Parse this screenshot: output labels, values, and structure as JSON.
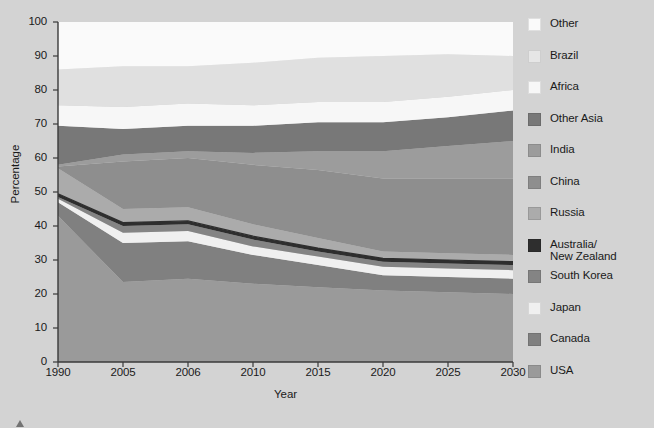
{
  "chart_data": {
    "type": "area",
    "stacked": true,
    "title": "",
    "xlabel": "Year",
    "ylabel": "Percentage",
    "x": [
      "1990",
      "2005",
      "2006",
      "2010",
      "2015",
      "2020",
      "2025",
      "2030"
    ],
    "xtick_labels": [
      "1990",
      "2005",
      "2006",
      "2010",
      "2015",
      "2020",
      "2025",
      "2030"
    ],
    "ytick_labels": [
      "0",
      "10",
      "20",
      "30",
      "40",
      "50",
      "60",
      "70",
      "80",
      "90",
      "100"
    ],
    "ylim": [
      0,
      100
    ],
    "yticks": [
      0,
      10,
      20,
      30,
      40,
      50,
      60,
      70,
      80,
      90,
      100
    ],
    "grid": false,
    "legend_position": "right",
    "stack_order_bottom_to_top": [
      "USA",
      "Canada",
      "Japan",
      "South Korea",
      "Australia/New Zealand",
      "Russia",
      "China",
      "India",
      "Other Asia",
      "Africa",
      "Brazil",
      "Other"
    ],
    "series": [
      {
        "name": "USA",
        "color": "#9a9a9a",
        "values": [
          43.0,
          23.5,
          24.5,
          23.0,
          22.0,
          21.0,
          20.5,
          20.0
        ]
      },
      {
        "name": "Canada",
        "color": "#808080",
        "values": [
          4.0,
          11.5,
          11.0,
          8.5,
          6.5,
          4.5,
          4.5,
          4.5
        ]
      },
      {
        "name": "Japan",
        "color": "#f0f0f0",
        "values": [
          1.0,
          3.0,
          3.0,
          2.5,
          2.5,
          2.5,
          2.5,
          2.5
        ]
      },
      {
        "name": "South Korea",
        "color": "#848484",
        "values": [
          0.5,
          2.0,
          2.0,
          2.0,
          1.5,
          1.5,
          1.5,
          1.5
        ]
      },
      {
        "name": "Australia/New Zealand",
        "color": "#2e2e2e",
        "values": [
          1.0,
          1.0,
          1.0,
          1.0,
          1.0,
          1.0,
          1.0,
          1.0
        ]
      },
      {
        "name": "Russia",
        "color": "#ababab",
        "values": [
          7.5,
          4.0,
          4.0,
          3.5,
          3.0,
          2.0,
          2.0,
          2.0
        ]
      },
      {
        "name": "China",
        "color": "#8e8e8e",
        "values": [
          0.5,
          14.0,
          14.5,
          17.5,
          20.0,
          21.5,
          22.0,
          22.5
        ]
      },
      {
        "name": "India",
        "color": "#9c9c9c",
        "values": [
          0.5,
          2.0,
          2.0,
          3.5,
          5.5,
          8.0,
          9.5,
          11.0
        ]
      },
      {
        "name": "Other Asia",
        "color": "#787878",
        "values": [
          11.5,
          7.5,
          7.5,
          8.0,
          8.5,
          8.5,
          8.5,
          9.0
        ]
      },
      {
        "name": "Africa",
        "color": "#f7f7f7",
        "values": [
          6.0,
          6.5,
          6.5,
          6.0,
          6.0,
          6.0,
          6.0,
          6.0
        ]
      },
      {
        "name": "Brazil",
        "color": "#e0e0e0",
        "values": [
          10.5,
          12.0,
          11.0,
          12.5,
          13.0,
          13.5,
          12.5,
          10.0
        ]
      },
      {
        "name": "Other",
        "color": "#fafafa",
        "values": [
          14.0,
          13.0,
          13.0,
          12.0,
          10.5,
          10.0,
          9.5,
          10.0
        ]
      }
    ],
    "cumulative_tops": {
      "USA": [
        43.0,
        23.5,
        24.5,
        23.0,
        22.0,
        21.0,
        20.5,
        20.0
      ],
      "Canada": [
        47.0,
        35.0,
        35.5,
        31.5,
        28.5,
        25.5,
        25.0,
        24.5
      ],
      "Japan": [
        48.0,
        38.0,
        38.5,
        34.0,
        31.0,
        28.0,
        27.5,
        27.0
      ],
      "South Korea": [
        48.5,
        40.0,
        40.5,
        36.0,
        32.5,
        29.5,
        29.0,
        28.5
      ],
      "Australia/New Zealand": [
        49.5,
        41.0,
        41.5,
        37.0,
        33.5,
        30.5,
        30.0,
        29.5
      ],
      "Russia": [
        57.0,
        45.0,
        45.5,
        40.5,
        36.5,
        32.5,
        32.0,
        31.5
      ],
      "China": [
        57.5,
        59.0,
        60.0,
        58.0,
        56.5,
        54.0,
        54.0,
        54.0
      ],
      "India": [
        58.0,
        61.0,
        62.0,
        61.5,
        62.0,
        62.0,
        63.5,
        65.0
      ],
      "Other Asia": [
        69.5,
        68.5,
        69.5,
        69.5,
        70.5,
        70.5,
        72.0,
        74.0
      ],
      "Africa": [
        75.5,
        75.0,
        76.0,
        75.5,
        76.5,
        76.5,
        78.0,
        80.0
      ],
      "Brazil": [
        86.0,
        87.0,
        87.0,
        88.0,
        89.5,
        90.0,
        90.5,
        90.0
      ],
      "Other": [
        100.0,
        100.0,
        100.0,
        100.0,
        100.0,
        100.0,
        100.0,
        100.0
      ]
    }
  },
  "legend": {
    "entries": [
      {
        "label": "Other",
        "color": "#fafafa"
      },
      {
        "label": "Brazil",
        "color": "#e6e6e6"
      },
      {
        "label": "Africa",
        "color": "#f7f7f7"
      },
      {
        "label": "Other Asia",
        "color": "#787878"
      },
      {
        "label": "India",
        "color": "#9c9c9c"
      },
      {
        "label": "China",
        "color": "#8e8e8e"
      },
      {
        "label": "Russia",
        "color": "#ababab"
      },
      {
        "label": "Australia/\nNew Zealand",
        "color": "#2e2e2e"
      },
      {
        "label": "South Korea",
        "color": "#848484"
      },
      {
        "label": "Japan",
        "color": "#f0f0f0"
      },
      {
        "label": "Canada",
        "color": "#808080"
      },
      {
        "label": "USA",
        "color": "#9a9a9a"
      }
    ]
  },
  "axes": {
    "y_title": "Percentage",
    "x_title": "Year"
  },
  "caption": {
    "text": ""
  },
  "colors": {
    "background": "#d3d3d3",
    "axis_line": "#3a3a3a",
    "text": "#1a1a1a"
  }
}
